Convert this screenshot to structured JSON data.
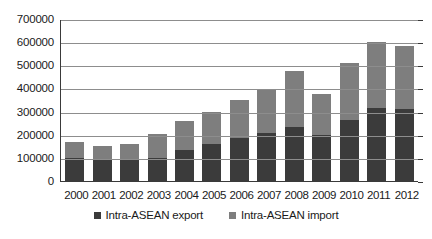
{
  "chart_data": {
    "type": "bar",
    "stacked": true,
    "title": "",
    "xlabel": "",
    "ylabel": "",
    "ylim": [
      0,
      700000
    ],
    "ytick_step": 100000,
    "grid": true,
    "legend_position": "bottom",
    "categories": [
      "2000",
      "2001",
      "2002",
      "2003",
      "2004",
      "2005",
      "2006",
      "2007",
      "2008",
      "2009",
      "2010",
      "2011",
      "2012"
    ],
    "ytick_labels": [
      "700000",
      "600000",
      "500000",
      "400000",
      "300000",
      "200000",
      "100000",
      "0"
    ],
    "series": [
      {
        "name": "Intra-ASEAN export",
        "color": "#3b3b3b",
        "values": [
          98000,
          96000,
          97000,
          98000,
          136000,
          162000,
          188000,
          207000,
          235000,
          197000,
          265000,
          316000,
          312000
        ]
      },
      {
        "name": "Intra-ASEAN import",
        "color": "#7e7e7e",
        "values": [
          70000,
          57000,
          62000,
          104000,
          124000,
          136000,
          160000,
          192000,
          240000,
          181000,
          247000,
          284000,
          270000
        ]
      }
    ],
    "totals": [
      168000,
      153000,
      159000,
      202000,
      260000,
      298000,
      348000,
      399000,
      475000,
      378000,
      512000,
      600000,
      582000
    ]
  },
  "colors": {
    "export": "#3b3b3b",
    "import": "#7e7e7e",
    "gridline": "#8d8d8d",
    "axis": "#3a3a3a",
    "background": "#ffffff",
    "text": "#1a1a1a"
  }
}
